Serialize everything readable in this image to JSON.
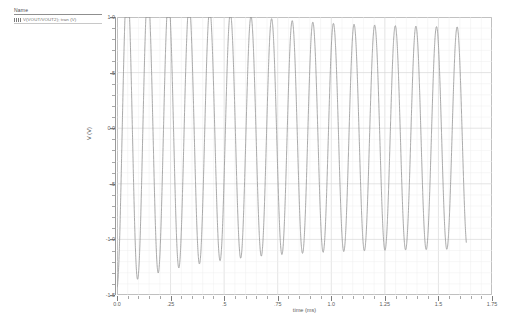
{
  "legend": {
    "header": "Name",
    "entries": [
      {
        "swatch": "dashed-line-swatch",
        "label": "V(VOUT/VOUT2); tran (V)"
      }
    ]
  },
  "axes": {
    "y_title": "V (V)",
    "x_title": "time (ms)",
    "y_ticks": [
      "1.0",
      ".5",
      "0.0",
      "-.5",
      "-1.0",
      "-1.5"
    ],
    "y_tick_values": [
      1.0,
      0.5,
      0.0,
      -0.5,
      -1.0,
      -1.5
    ],
    "x_ticks": [
      "0.0",
      ".25",
      ".5",
      ".75",
      "1.0",
      "1.25",
      "1.5",
      "1.75"
    ],
    "x_tick_values": [
      0.0,
      0.25,
      0.5,
      0.75,
      1.0,
      1.25,
      1.5,
      1.75
    ]
  },
  "caption": "",
  "colors": {
    "trace": "#9a9a9a",
    "grid_major": "#d9d9d9",
    "grid_minor": "#efefef",
    "frame": "#b4b4b4",
    "axis_text": "#5c5c5c"
  },
  "chart_data": {
    "type": "line",
    "title": "",
    "xlabel": "time (ms)",
    "ylabel": "V (V)",
    "xlim": [
      0.0,
      1.75
    ],
    "ylim": [
      -1.5,
      1.0
    ],
    "grid": true,
    "legend_position": "top-left-outside",
    "xticks": [
      0.0,
      0.25,
      0.5,
      0.75,
      1.0,
      1.25,
      1.5,
      1.75
    ],
    "yticks": [
      -1.5,
      -1.0,
      -0.5,
      0.0,
      0.5,
      1.0
    ],
    "x_minor_per_major": 5,
    "y_minor_per_major": 5,
    "series": [
      {
        "name": "V(VOUT/VOUT2); tran (V)",
        "color": "#9a9a9a",
        "style": "dotted-line",
        "t_start": 0.0,
        "t_end": 1.63,
        "frequency_khz": 10.4,
        "period_ms": 0.0962,
        "dc_offset_final": -0.09,
        "amplitude_final": 0.99,
        "phase_deg": -90,
        "envelope_tau_ms": 0.42,
        "amplitude_initial": 1.4,
        "offset_initial": -0.03,
        "peaks": [
          {
            "t": 0.072,
            "v": -1.42
          },
          {
            "t": 0.121,
            "v": 0.6
          },
          {
            "t": 0.168,
            "v": -1.22
          },
          {
            "t": 0.217,
            "v": 0.68
          },
          {
            "t": 0.264,
            "v": -1.16
          },
          {
            "t": 0.313,
            "v": 0.76
          },
          {
            "t": 0.36,
            "v": -1.13
          },
          {
            "t": 0.409,
            "v": 0.81
          },
          {
            "t": 0.457,
            "v": -1.1
          },
          {
            "t": 0.505,
            "v": 0.84
          },
          {
            "t": 0.553,
            "v": -1.09
          },
          {
            "t": 0.601,
            "v": 0.86
          },
          {
            "t": 0.649,
            "v": -1.08
          },
          {
            "t": 0.697,
            "v": 0.87
          },
          {
            "t": 0.745,
            "v": -1.08
          },
          {
            "t": 0.793,
            "v": 0.88
          },
          {
            "t": 0.842,
            "v": -1.08
          },
          {
            "t": 0.89,
            "v": 0.89
          },
          {
            "t": 0.938,
            "v": -1.07
          },
          {
            "t": 0.986,
            "v": 0.89
          },
          {
            "t": 1.034,
            "v": -1.07
          },
          {
            "t": 1.082,
            "v": 0.9
          },
          {
            "t": 1.13,
            "v": -1.07
          },
          {
            "t": 1.178,
            "v": 0.9
          },
          {
            "t": 1.226,
            "v": -1.07
          },
          {
            "t": 1.274,
            "v": 0.9
          },
          {
            "t": 1.323,
            "v": -1.07
          },
          {
            "t": 1.371,
            "v": 0.9
          },
          {
            "t": 1.419,
            "v": -1.07
          },
          {
            "t": 1.467,
            "v": 0.9
          },
          {
            "t": 1.515,
            "v": -1.07
          },
          {
            "t": 1.563,
            "v": 0.9
          },
          {
            "t": 1.611,
            "v": -1.07
          }
        ]
      }
    ]
  }
}
